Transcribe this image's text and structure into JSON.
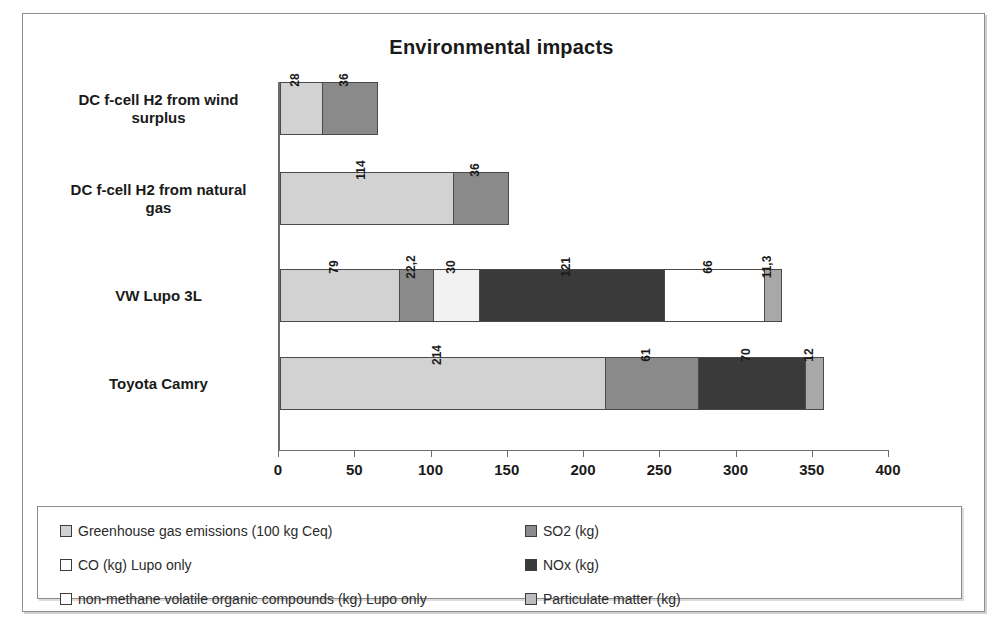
{
  "chart_data": {
    "type": "bar",
    "orientation": "horizontal",
    "stacked": true,
    "title": "Environmental impacts",
    "xlabel": "",
    "ylabel": "",
    "xlim": [
      0,
      400
    ],
    "xticks": [
      0,
      50,
      100,
      150,
      200,
      250,
      300,
      350,
      400
    ],
    "grid": false,
    "legend_position": "bottom",
    "decimal_separator": ",",
    "categories": [
      "Toyota Camry",
      "VW Lupo 3L",
      "DC f-cell H2 from natural gas",
      "DC f-cell H2 from wind surplus"
    ],
    "series": [
      {
        "name": "Greenhouse gas emissions (100 kg Ceq)",
        "color": "#d2d2d2",
        "values": [
          214,
          79,
          114,
          28
        ],
        "labels": [
          "214",
          "79",
          "114",
          "28"
        ]
      },
      {
        "name": "SO2 (kg)",
        "color": "#8a8a8a",
        "values": [
          61,
          22.2,
          36,
          36
        ],
        "labels": [
          "61",
          "22,2",
          "36",
          "36"
        ]
      },
      {
        "name": "CO (kg) Lupo only",
        "color": "#f2f2f2",
        "values": [
          0,
          30,
          0,
          0
        ],
        "labels": [
          "",
          "30",
          "",
          ""
        ]
      },
      {
        "name": "NOx (kg)",
        "color": "#3a3a3a",
        "values": [
          70,
          121,
          0,
          0
        ],
        "labels": [
          "70",
          "121",
          "",
          ""
        ]
      },
      {
        "name": "non-methane volatile organic compounds (kg) Lupo only",
        "color": "#ffffff",
        "values": [
          0,
          66,
          0,
          0
        ],
        "labels": [
          "",
          "66",
          "",
          ""
        ]
      },
      {
        "name": "Particulate matter (kg)",
        "color": "#a8a8a8",
        "values": [
          12,
          11.3,
          0,
          0
        ],
        "labels": [
          "12",
          "11,3",
          "",
          ""
        ]
      }
    ],
    "totals": [
      357,
      329.5,
      150,
      64
    ]
  },
  "title": "Environmental impacts",
  "categories": [
    {
      "line1": "DC f-cell H2 from wind",
      "line2": "surplus"
    },
    {
      "line1": "DC f-cell H2 from natural",
      "line2": "gas"
    },
    {
      "line1": "VW Lupo 3L",
      "line2": ""
    },
    {
      "line1": "Toyota Camry",
      "line2": ""
    }
  ],
  "bars": [
    {
      "category": "DC f-cell H2 from wind surplus",
      "segments": [
        {
          "series": "Greenhouse gas emissions (100 kg Ceq)",
          "value": 28,
          "label": "28",
          "color": "#d2d2d2"
        },
        {
          "series": "SO2 (kg)",
          "value": 36,
          "label": "36",
          "color": "#8a8a8a"
        }
      ]
    },
    {
      "category": "DC f-cell H2 from natural gas",
      "segments": [
        {
          "series": "Greenhouse gas emissions (100 kg Ceq)",
          "value": 114,
          "label": "114",
          "color": "#d2d2d2"
        },
        {
          "series": "SO2 (kg)",
          "value": 36,
          "label": "36",
          "color": "#8a8a8a"
        }
      ]
    },
    {
      "category": "VW Lupo 3L",
      "segments": [
        {
          "series": "Greenhouse gas emissions (100 kg Ceq)",
          "value": 79,
          "label": "79",
          "color": "#d2d2d2"
        },
        {
          "series": "SO2 (kg)",
          "value": 22.2,
          "label": "22,2",
          "color": "#8a8a8a"
        },
        {
          "series": "CO (kg) Lupo only",
          "value": 30,
          "label": "30",
          "color": "#f2f2f2"
        },
        {
          "series": "NOx (kg)",
          "value": 121,
          "label": "121",
          "color": "#3a3a3a"
        },
        {
          "series": "non-methane volatile organic compounds (kg) Lupo only",
          "value": 66,
          "label": "66",
          "color": "#ffffff"
        },
        {
          "series": "Particulate matter (kg)",
          "value": 11.3,
          "label": "11,3",
          "color": "#a8a8a8"
        }
      ]
    },
    {
      "category": "Toyota Camry",
      "segments": [
        {
          "series": "Greenhouse gas emissions (100 kg Ceq)",
          "value": 214,
          "label": "214",
          "color": "#d2d2d2"
        },
        {
          "series": "SO2 (kg)",
          "value": 61,
          "label": "61",
          "color": "#8a8a8a"
        },
        {
          "series": "NOx (kg)",
          "value": 70,
          "label": "70",
          "color": "#3a3a3a"
        },
        {
          "series": "Particulate matter (kg)",
          "value": 12,
          "label": "12",
          "color": "#a8a8a8"
        }
      ]
    }
  ],
  "xaxis": {
    "ticks": [
      "0",
      "50",
      "100",
      "150",
      "200",
      "250",
      "300",
      "350",
      "400"
    ]
  },
  "legend": {
    "left": [
      {
        "label": "Greenhouse gas emissions (100 kg Ceq)",
        "color": "#d2d2d2"
      },
      {
        "label": "CO (kg) Lupo only",
        "color": "#ffffff"
      },
      {
        "label": "non-methane volatile organic compounds (kg) Lupo only",
        "color": "#ffffff"
      }
    ],
    "right": [
      {
        "label": "SO2 (kg)",
        "color": "#8a8a8a"
      },
      {
        "label": "NOx (kg)",
        "color": "#3a3a3a"
      },
      {
        "label": "Particulate matter (kg)",
        "color": "#bdbdbd"
      }
    ]
  }
}
